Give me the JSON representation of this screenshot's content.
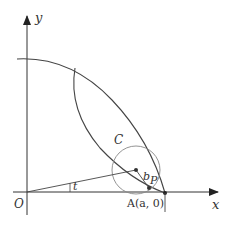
{
  "diagram": {
    "type": "geometric-figure",
    "colors": {
      "stroke": "#333333",
      "circle": "#888888",
      "background": "#ffffff"
    },
    "axes": {
      "x_label": "x",
      "y_label": "y",
      "origin_label": "O"
    },
    "labels": {
      "angle": "t",
      "circle": "C",
      "radius": "b",
      "point_p": "P",
      "point_a": "A(a, 0)"
    }
  }
}
